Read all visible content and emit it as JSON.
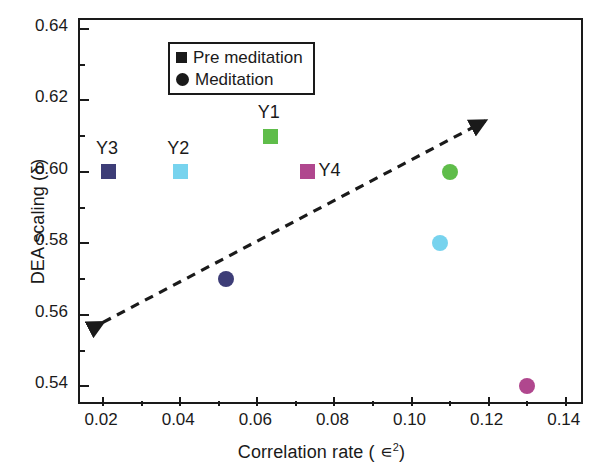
{
  "chart_data": {
    "type": "scatter",
    "title": "",
    "xlabel": "Correlation rate ( ∊2)",
    "xlabel_base": "Correlation rate ( ∊",
    "xlabel_sup": "2",
    "xlabel_close": ")",
    "ylabel": "DEA scaling (δ)",
    "xlim": [
      0.014,
      0.145
    ],
    "ylim": [
      0.5345,
      0.6425
    ],
    "xticks": [
      0.02,
      0.04,
      0.06,
      0.08,
      0.1,
      0.12,
      0.14
    ],
    "xtick_labels": [
      "0.02",
      "0.04",
      "0.06",
      "0.08",
      "0.10",
      "0.12",
      "0.14"
    ],
    "xticks_minor": [
      0.03,
      0.05,
      0.07,
      0.09,
      0.11,
      0.13
    ],
    "yticks": [
      0.54,
      0.56,
      0.58,
      0.6,
      0.62,
      0.64
    ],
    "ytick_labels": [
      "0.54",
      "0.56",
      "0.58",
      "0.60",
      "0.62",
      "0.64"
    ],
    "yticks_minor": [
      0.55,
      0.57,
      0.59,
      0.61,
      0.63
    ],
    "grid": false,
    "legend_position": "top-left",
    "legend": [
      {
        "label": "Pre meditation",
        "marker": "square"
      },
      {
        "label": "Meditation",
        "marker": "circle"
      }
    ],
    "series": [
      {
        "name": "Pre meditation",
        "marker": "square",
        "points": [
          {
            "label": "Y3",
            "x": 0.0215,
            "y": 0.6,
            "color": "#3d3d77",
            "label_pos": "above"
          },
          {
            "label": "Y2",
            "x": 0.04,
            "y": 0.6,
            "color": "#77d3ee",
            "label_pos": "above"
          },
          {
            "label": "Y1",
            "x": 0.0635,
            "y": 0.61,
            "color": "#5fbd4a",
            "label_pos": "above"
          },
          {
            "label": "Y4",
            "x": 0.073,
            "y": 0.6,
            "color": "#b0478e",
            "label_pos": "right"
          }
        ]
      },
      {
        "name": "Meditation",
        "marker": "circle",
        "points": [
          {
            "label": "",
            "x": 0.052,
            "y": 0.57,
            "color": "#3d3d77",
            "label_pos": "none"
          },
          {
            "label": "",
            "x": 0.1075,
            "y": 0.58,
            "color": "#77d3ee",
            "label_pos": "none"
          },
          {
            "label": "",
            "x": 0.11,
            "y": 0.6,
            "color": "#5fbd4a",
            "label_pos": "none"
          },
          {
            "label": "",
            "x": 0.13,
            "y": 0.54,
            "color": "#b0478e",
            "label_pos": "none"
          }
        ]
      }
    ],
    "trendline": {
      "style": "dashed",
      "color": "#1a1a1a",
      "arrow_start": true,
      "arrow_end": true,
      "x0": 0.02,
      "y0": 0.557,
      "x1": 0.12,
      "y1": 0.614
    },
    "colors": {
      "axis": "#1a1a1a",
      "background": "#ffffff",
      "navy": "#3d3d77",
      "cyan": "#77d3ee",
      "green": "#5fbd4a",
      "magenta": "#b0478e"
    }
  }
}
